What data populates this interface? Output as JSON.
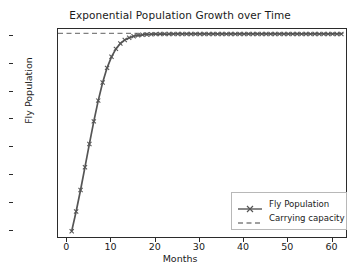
{
  "chart_data": {
    "type": "line",
    "title": "Exponential Population Growth over Time",
    "xlabel": "Months",
    "ylabel": "Fly Population",
    "xlim": [
      -2.1,
      63.5
    ],
    "ylim": [
      93,
      281
    ],
    "xticks": [
      0,
      10,
      20,
      30,
      40,
      50,
      60
    ],
    "xtick_labels": [
      "0",
      "10",
      "20",
      "30",
      "40",
      "50",
      "60"
    ],
    "yticks": [
      100,
      125,
      150,
      175,
      200,
      225,
      250,
      275
    ],
    "ytick_labels": [
      "100",
      "125",
      "150",
      "175",
      "200",
      "225",
      "250",
      "275"
    ],
    "grid": false,
    "legend_position": "lower right",
    "series": [
      {
        "name": "Fly Population",
        "style": "solid-with-x-markers",
        "color": "#555555",
        "x": [
          1,
          2,
          3,
          4,
          5,
          6,
          7,
          8,
          9,
          10,
          11,
          12,
          13,
          14,
          15,
          16,
          17,
          18,
          19,
          20,
          21,
          22,
          23,
          24,
          25,
          26,
          27,
          28,
          29,
          30,
          31,
          32,
          33,
          34,
          35,
          36,
          37,
          38,
          39,
          40,
          41,
          42,
          43,
          44,
          45,
          46,
          47,
          48,
          49,
          50,
          51,
          52,
          53,
          54,
          55,
          56,
          57,
          58,
          59,
          60,
          61,
          62
        ],
        "values": [
          100.0,
          117.6,
          136.9,
          157.3,
          178.1,
          198.3,
          216.9,
          233.1,
          246.2,
          256.1,
          263.2,
          268.0,
          271.2,
          273.2,
          274.5,
          275.3,
          275.8,
          276.1,
          276.3,
          276.4,
          276.5,
          276.5,
          276.5,
          276.6,
          276.6,
          276.6,
          276.6,
          276.6,
          276.6,
          276.6,
          276.6,
          276.6,
          276.6,
          276.6,
          276.6,
          276.6,
          276.6,
          276.6,
          276.6,
          276.6,
          276.6,
          276.6,
          276.6,
          276.6,
          276.6,
          276.6,
          276.6,
          276.6,
          276.6,
          276.6,
          276.6,
          276.6,
          276.6,
          276.6,
          276.6,
          276.6,
          276.6,
          276.6,
          276.6,
          276.6,
          276.6,
          276.6
        ]
      },
      {
        "name": "Carrying capacity",
        "style": "dashed",
        "color": "#808080",
        "value": 277.0
      }
    ],
    "annotations": []
  },
  "legend": {
    "items": [
      {
        "label": "Fly Population"
      },
      {
        "label": "Carrying capacity"
      }
    ]
  },
  "colors": {
    "series_line": "#555555",
    "capacity_line": "#808080",
    "axis": "#2b2b2b",
    "text": "#1a1a1a",
    "background": "#ffffff"
  }
}
